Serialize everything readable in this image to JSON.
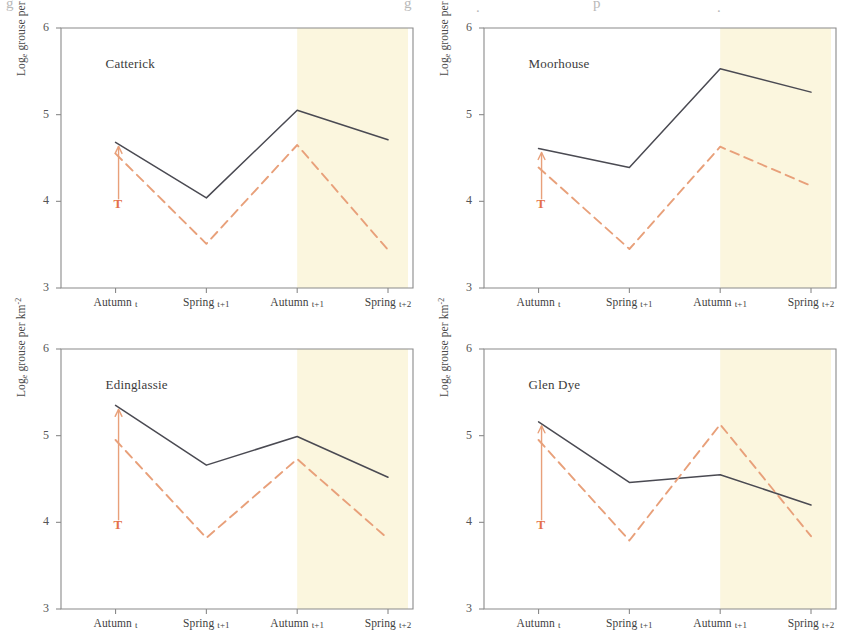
{
  "figure": {
    "ylabel_main": "Log",
    "ylabel_sub": "e",
    "ylabel_rest": " grouse per km",
    "ylabel_sup": "-2",
    "treatment_marker": "T",
    "colors": {
      "treated_line": "#e8a07a",
      "control_line": "#4a4a52",
      "shaded_band": "#fbf6de",
      "axis": "#8a8a8a",
      "treatment_label": "#e4714a",
      "title_text": "#3b3b3b"
    },
    "axis": {
      "y_ticks": [
        "6",
        "5",
        "4",
        "3"
      ],
      "y_values": [
        6,
        5,
        4,
        3
      ],
      "ylim": [
        3,
        6
      ],
      "x_ticks": [
        "Autumn t",
        "Spring t+1",
        "Autumn t+1",
        "Spring t+2"
      ]
    },
    "crop_glyphs": [
      {
        "x": 6,
        "y": -4,
        "ch": "g"
      },
      {
        "x": 404,
        "y": -4,
        "ch": "g"
      },
      {
        "x": 593,
        "y": -4,
        "ch": "p"
      },
      {
        "x": 476,
        "y": 0,
        "ch": "."
      },
      {
        "x": 717,
        "y": 0,
        "ch": "."
      }
    ]
  },
  "chart_data": [
    {
      "type": "line",
      "title": "Catterick",
      "xlabel": "",
      "ylabel": "Loge grouse per km-2",
      "categories": [
        "Autumn t",
        "Spring t+1",
        "Autumn t+1",
        "Spring t+2"
      ],
      "ylim": [
        3,
        6
      ],
      "grid": false,
      "legend": "none",
      "shaded_region": {
        "from": "Autumn t+1",
        "to": "Spring t+2",
        "label": "treatment period"
      },
      "annotation": {
        "text": "T",
        "at": "Autumn t",
        "arrow": "up"
      },
      "series": [
        {
          "name": "Control (solid)",
          "style": "solid",
          "color": "#4a4a52",
          "values": [
            4.68,
            4.04,
            5.05,
            4.71
          ]
        },
        {
          "name": "Treated (dashed)",
          "style": "dashed",
          "color": "#e8a07a",
          "values": [
            4.55,
            3.51,
            4.65,
            3.44
          ]
        }
      ]
    },
    {
      "type": "line",
      "title": "Moorhouse",
      "xlabel": "",
      "ylabel": "Loge grouse per km-2",
      "categories": [
        "Autumn t",
        "Spring t+1",
        "Autumn t+1",
        "Spring t+2"
      ],
      "ylim": [
        3,
        6
      ],
      "grid": false,
      "legend": "none",
      "shaded_region": {
        "from": "Autumn t+1",
        "to": "Spring t+2",
        "label": "treatment period"
      },
      "annotation": {
        "text": "T",
        "at": "Autumn t",
        "arrow": "up"
      },
      "series": [
        {
          "name": "Control (solid)",
          "style": "solid",
          "color": "#4a4a52",
          "values": [
            4.61,
            4.39,
            5.53,
            5.26
          ]
        },
        {
          "name": "Treated (dashed)",
          "style": "dashed",
          "color": "#e8a07a",
          "values": [
            4.39,
            3.45,
            4.63,
            4.18
          ]
        }
      ]
    },
    {
      "type": "line",
      "title": "Edinglassie",
      "xlabel": "",
      "ylabel": "Loge grouse per km-2",
      "categories": [
        "Autumn t",
        "Spring t+1",
        "Autumn t+1",
        "Spring t+2"
      ],
      "ylim": [
        3,
        6
      ],
      "grid": false,
      "legend": "none",
      "shaded_region": {
        "from": "Autumn t+1",
        "to": "Spring t+2",
        "label": "treatment period"
      },
      "annotation": {
        "text": "T",
        "at": "Autumn t",
        "arrow": "up"
      },
      "series": [
        {
          "name": "Control (solid)",
          "style": "solid",
          "color": "#4a4a52",
          "values": [
            5.35,
            4.66,
            4.99,
            4.52
          ]
        },
        {
          "name": "Treated (dashed)",
          "style": "dashed",
          "color": "#e8a07a",
          "values": [
            4.95,
            3.82,
            4.73,
            3.81
          ]
        }
      ]
    },
    {
      "type": "line",
      "title": "Glen Dye",
      "xlabel": "",
      "ylabel": "Loge grouse per km-2",
      "categories": [
        "Autumn t",
        "Spring t+1",
        "Autumn t+1",
        "Spring t+2"
      ],
      "ylim": [
        3,
        6
      ],
      "grid": false,
      "legend": "none",
      "shaded_region": {
        "from": "Autumn t+1",
        "to": "Spring t+2",
        "label": "treatment period"
      },
      "annotation": {
        "text": "T",
        "at": "Autumn t",
        "arrow": "up"
      },
      "series": [
        {
          "name": "Control (solid)",
          "style": "solid",
          "color": "#4a4a52",
          "values": [
            5.16,
            4.46,
            4.55,
            4.2
          ]
        },
        {
          "name": "Treated (dashed)",
          "style": "dashed",
          "color": "#e8a07a",
          "values": [
            4.95,
            3.79,
            5.13,
            3.84
          ]
        }
      ]
    }
  ]
}
